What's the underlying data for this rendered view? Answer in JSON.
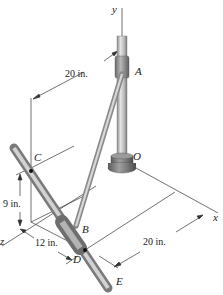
{
  "figure": {
    "type": "3D mechanics diagram"
  },
  "axes": {
    "x": "x",
    "y": "y",
    "z": "z"
  },
  "points": {
    "A": "A",
    "B": "B",
    "C": "C",
    "D": "D",
    "E": "E",
    "O": "O"
  },
  "dimensions": {
    "top_20": "20 in.",
    "left_9": "9 in.",
    "bottom_12": "12 in.",
    "bottom_20": "20 in."
  },
  "colors": {
    "rod_light": "#d6d6d6",
    "rod_mid": "#a8a8a8",
    "rod_dark": "#6e6e6e",
    "line": "#333333",
    "background": "#ffffff"
  }
}
